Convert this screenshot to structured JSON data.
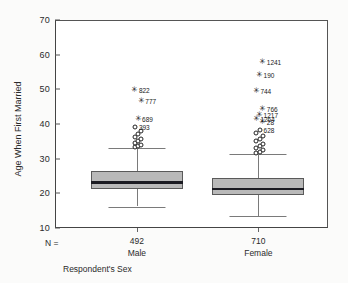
{
  "chart": {
    "type": "boxplot",
    "y_axis_title": "Age When First Married",
    "x_axis_title": "Respondent's Sex",
    "n_label": "N =",
    "y_ticks": [
      "70",
      "60",
      "50",
      "40",
      "30",
      "20",
      "10"
    ],
    "y_min": 10,
    "y_max": 70
  },
  "chart_data": {
    "type": "boxplot",
    "title": "",
    "xlabel": "Respondent's Sex",
    "ylabel": "Age When First Married",
    "ylim": [
      10,
      70
    ],
    "yticks": [
      10,
      20,
      30,
      40,
      50,
      60,
      70
    ],
    "grid": false,
    "legend": "none",
    "categories": [
      "Male",
      "Female"
    ],
    "counts": [
      492,
      710
    ],
    "count_label": "N =",
    "series": [
      {
        "name": "Male",
        "n": 492,
        "whisker_low": 16.2,
        "q1": 21.3,
        "median": 23.1,
        "q3": 26.3,
        "whisker_high": 33.0,
        "outliers": [
          {
            "value": 33.3,
            "marker": "circle",
            "label": ""
          },
          {
            "value": 33.6,
            "marker": "circle",
            "label": ""
          },
          {
            "value": 34.0,
            "marker": "circle",
            "label": ""
          },
          {
            "value": 34.4,
            "marker": "circle",
            "label": ""
          },
          {
            "value": 35.0,
            "marker": "circle",
            "label": ""
          },
          {
            "value": 35.6,
            "marker": "circle",
            "label": ""
          },
          {
            "value": 36.2,
            "marker": "circle",
            "label": ""
          },
          {
            "value": 37.0,
            "marker": "circle",
            "label": ""
          },
          {
            "value": 38.0,
            "marker": "circle",
            "label": ""
          },
          {
            "value": 39.0,
            "marker": "circle",
            "label": "393"
          },
          {
            "value": 41.5,
            "marker": "star",
            "label": "689"
          },
          {
            "value": 46.5,
            "marker": "star",
            "label": "777"
          },
          {
            "value": 49.8,
            "marker": "star",
            "label": "822"
          }
        ]
      },
      {
        "name": "Female",
        "n": 710,
        "whisker_low": 13.4,
        "q1": 19.4,
        "median": 21.3,
        "q3": 24.3,
        "whisker_high": 31.3,
        "outliers": [
          {
            "value": 31.6,
            "marker": "circle",
            "label": ""
          },
          {
            "value": 32.0,
            "marker": "circle",
            "label": ""
          },
          {
            "value": 32.5,
            "marker": "circle",
            "label": ""
          },
          {
            "value": 33.0,
            "marker": "circle",
            "label": ""
          },
          {
            "value": 33.6,
            "marker": "circle",
            "label": ""
          },
          {
            "value": 34.2,
            "marker": "circle",
            "label": ""
          },
          {
            "value": 35.0,
            "marker": "circle",
            "label": ""
          },
          {
            "value": 35.8,
            "marker": "circle",
            "label": ""
          },
          {
            "value": 36.6,
            "marker": "circle",
            "label": ""
          },
          {
            "value": 37.4,
            "marker": "circle",
            "label": ""
          },
          {
            "value": 38.2,
            "marker": "circle",
            "label": "628"
          },
          {
            "value": 40.6,
            "marker": "star",
            "label": "28"
          },
          {
            "value": 41.4,
            "marker": "star",
            "label": "1264"
          },
          {
            "value": 42.6,
            "marker": "star",
            "label": "1217"
          },
          {
            "value": 44.4,
            "marker": "star",
            "label": "766"
          },
          {
            "value": 49.6,
            "marker": "star",
            "label": "744"
          },
          {
            "value": 54.0,
            "marker": "star",
            "label": "190"
          },
          {
            "value": 58.0,
            "marker": "star",
            "label": "1241"
          }
        ]
      }
    ]
  }
}
